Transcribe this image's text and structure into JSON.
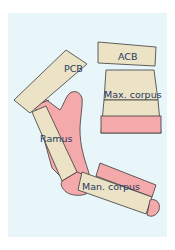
{
  "diagram": {
    "background_color": "#e8f6fa",
    "bone_color": "#ece2c6",
    "soft_tissue_color": "#f4a9aa",
    "labels": {
      "pcb": "PCB",
      "acb": "ACB",
      "max_corpus": "Max. corpus",
      "ramus": "Ramus",
      "man_corpus": "Man. corpus"
    }
  }
}
